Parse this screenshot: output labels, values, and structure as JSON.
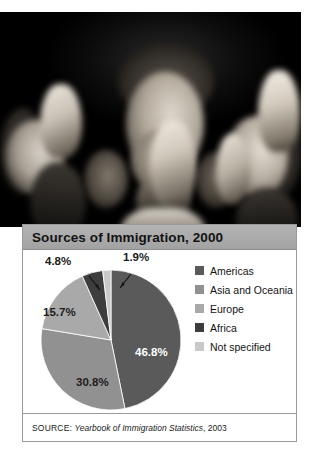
{
  "figure": {
    "photo": {
      "alt_description": "Black and white photograph of people at a naturalization ceremony raising their right hands to take the oath of citizenship"
    }
  },
  "panel": {
    "title": "Sources of Immigration, 2000",
    "source": {
      "prefix": "SOURCE:",
      "title": "Yearbook of Immigration Statistics",
      "year": ", 2003"
    }
  },
  "legend": {
    "items": [
      {
        "label": "Americas",
        "color": "#5a5a5a"
      },
      {
        "label": "Asia and Oceania",
        "color": "#919191"
      },
      {
        "label": "Europe",
        "color": "#a9a9a9"
      },
      {
        "label": "Africa",
        "color": "#3d3d3d"
      },
      {
        "label": "Not specified",
        "color": "#c9c9c9"
      }
    ]
  },
  "labels": {
    "americas": "46.8%",
    "asia_oceania": "30.8%",
    "europe": "15.7%",
    "africa": "4.8%",
    "not_specified": "1.9%"
  },
  "chart_data": {
    "type": "pie",
    "title": "Sources of Immigration, 2000",
    "xlabel": "",
    "ylabel": "",
    "unit": "percent",
    "legend_position": "right",
    "grid": false,
    "start_angle_deg": 0,
    "direction": "clockwise",
    "categories": [
      "Americas",
      "Asia and Oceania",
      "Europe",
      "Africa",
      "Not specified"
    ],
    "values": [
      46.8,
      30.8,
      15.7,
      4.8,
      1.9
    ],
    "colors": [
      "#5a5a5a",
      "#919191",
      "#a9a9a9",
      "#3d3d3d",
      "#c9c9c9"
    ],
    "data_labels": [
      "46.8%",
      "30.8%",
      "15.7%",
      "4.8%",
      "1.9%"
    ],
    "source": "SOURCE: Yearbook of Immigration Statistics, 2003"
  }
}
